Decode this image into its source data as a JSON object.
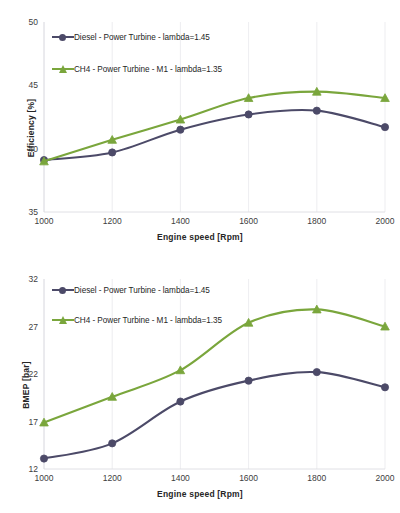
{
  "figure": {
    "title": "",
    "series_colors": {
      "diesel": "#4c4a68",
      "ch4": "#7aa63c"
    }
  },
  "chart_data": [
    {
      "type": "line",
      "title": "",
      "xlabel": "Engine speed [Rpm]",
      "ylabel": "Efficiency [%]",
      "x": [
        1000,
        1200,
        1400,
        1600,
        1800,
        2000
      ],
      "xticklabels": [
        "1000",
        "1200",
        "1400",
        "1600",
        "1800",
        "2000"
      ],
      "xlim": [
        1000,
        2000
      ],
      "yticks": [
        35,
        40,
        45,
        50
      ],
      "yticklabels": [
        "35",
        "40",
        "45",
        "50"
      ],
      "ylim": [
        35,
        50
      ],
      "grid": "vertical-light",
      "legend_position": "upper-left-inside",
      "series": [
        {
          "name": "Diesel - Power Turbine - lambda=1.45",
          "color": "#4c4a68",
          "marker": "circle",
          "values": [
            39.1,
            39.7,
            41.5,
            42.7,
            43.0,
            41.7
          ]
        },
        {
          "name": "CH4 - Power Turbine - M1 - lambda=1.35",
          "color": "#7aa63c",
          "marker": "triangle",
          "values": [
            39.0,
            40.7,
            42.3,
            44.0,
            44.5,
            44.0
          ]
        }
      ]
    },
    {
      "type": "line",
      "title": "",
      "xlabel": "Engine speed [Rpm]",
      "ylabel": "BMEP [bar]",
      "x": [
        1000,
        1200,
        1400,
        1600,
        1800,
        2000
      ],
      "xticklabels": [
        "1000",
        "1200",
        "1400",
        "1600",
        "1800",
        "2000"
      ],
      "xlim": [
        1000,
        2000
      ],
      "yticks": [
        12,
        17,
        22,
        27,
        32
      ],
      "yticklabels": [
        "12",
        "17",
        "22",
        "27",
        "32"
      ],
      "ylim": [
        12,
        32
      ],
      "grid": "vertical-light",
      "legend_position": "upper-left-inside",
      "series": [
        {
          "name": "Diesel - Power Turbine - lambda=1.45",
          "color": "#4c4a68",
          "marker": "circle",
          "values": [
            13.1,
            14.7,
            19.1,
            21.3,
            22.2,
            20.6
          ]
        },
        {
          "name": "CH4 - Power Turbine - M1 - lambda=1.35",
          "color": "#7aa63c",
          "marker": "triangle",
          "values": [
            16.9,
            19.6,
            22.4,
            27.4,
            28.8,
            27.0
          ]
        }
      ]
    }
  ]
}
